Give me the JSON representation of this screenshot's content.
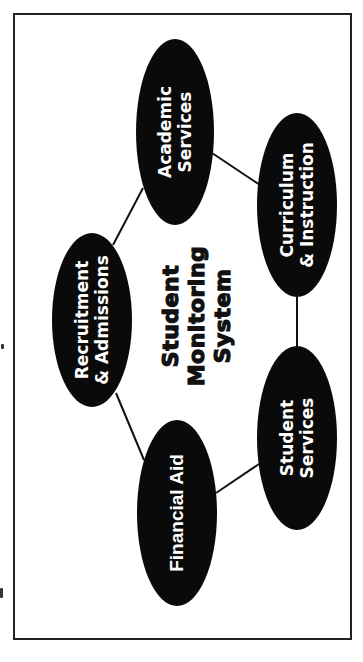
{
  "diagram": {
    "title_lines": [
      "Student",
      "Monitoring",
      "System"
    ],
    "orientation": "rotated -90 degrees",
    "node_fill": "#0a0a0a",
    "node_text_color": "#ffffff",
    "edge_color": "#111111",
    "frame_color": "#222222",
    "nodes": [
      {
        "id": "academic-services",
        "lines": [
          "Academic",
          "Services"
        ]
      },
      {
        "id": "curriculum-instruction",
        "lines": [
          "Curriculum",
          "& Instruction"
        ]
      },
      {
        "id": "recruitment-admissions",
        "lines": [
          "Recruitment",
          "& Admissions"
        ]
      },
      {
        "id": "financial-aid",
        "lines": [
          "Financial Aid"
        ]
      },
      {
        "id": "student-services",
        "lines": [
          "Student",
          "Services"
        ]
      }
    ],
    "edges": [
      [
        "academic-services",
        "recruitment-admissions"
      ],
      [
        "academic-services",
        "curriculum-instruction"
      ],
      [
        "recruitment-admissions",
        "financial-aid"
      ],
      [
        "financial-aid",
        "student-services"
      ],
      [
        "curriculum-instruction",
        "student-services"
      ]
    ]
  }
}
